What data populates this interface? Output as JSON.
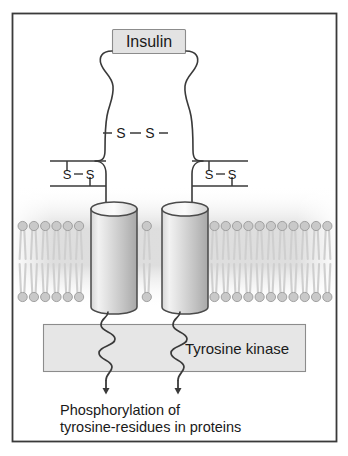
{
  "figure": {
    "frame": {
      "border_color": "#3a3a3a",
      "background": "#ffffff"
    },
    "ligand": {
      "label": "Insulin",
      "box_fill": "#e3e3e3",
      "box_border": "#8c8c8c",
      "text_color": "#1a1a1a"
    },
    "disulfide_bonds": [
      {
        "name": "central",
        "label_left": "S",
        "label_right": "S",
        "dash": "–"
      },
      {
        "name": "left-alpha-beta",
        "label_left": "S",
        "label_right": "S",
        "dash": "–"
      },
      {
        "name": "right-alpha-beta",
        "label_left": "S",
        "label_right": "S",
        "dash": "–"
      }
    ],
    "membrane": {
      "name": "lipid-bilayer",
      "head_count": 28,
      "head_fill": "#c9c9c9",
      "head_stroke": "#9a9a9a",
      "tail_color": "#cfcfcf",
      "halo_color": "#dedede"
    },
    "transmembrane": {
      "name": "beta-subunit-cylinders",
      "count": 2,
      "fill_light": "#efefef",
      "fill_dark": "#b4b4b4",
      "stroke": "#4a4a4a"
    },
    "kinase": {
      "label": "Tyrosine kinase",
      "box_fill": "#e6e6e6",
      "box_border": "#8c8c8c",
      "text_color": "#1a1a1a"
    },
    "output": {
      "line1": "Phosphorylation of",
      "line2": "tyrosine-residues in proteins",
      "text_color": "#1a1a1a",
      "arrow_count": 2,
      "arrow_color": "#3a3a3a"
    },
    "chain_color": "#3a3a3a"
  }
}
